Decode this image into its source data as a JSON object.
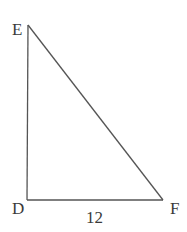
{
  "diagram": {
    "type": "right-triangle",
    "vertices": {
      "E": {
        "label": "E",
        "x": 28,
        "y": 25
      },
      "D": {
        "label": "D",
        "x": 27,
        "y": 200
      },
      "F": {
        "label": "F",
        "x": 163,
        "y": 200
      }
    },
    "side_labels": {
      "DF": "12"
    },
    "right_angle_at": "D",
    "stroke_color": "#555555",
    "label_color": "#3a3a3a"
  }
}
